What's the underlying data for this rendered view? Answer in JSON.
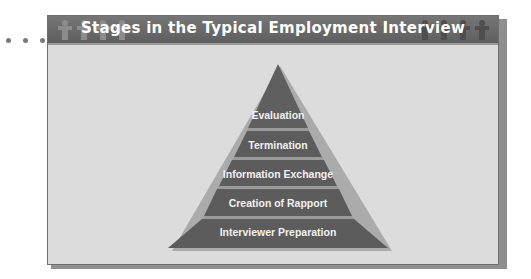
{
  "title": "Stages in the Typical Employment Interview",
  "decor": {
    "dots": 3,
    "people_left": 4,
    "people_right": 4
  },
  "pyramid": {
    "stages": [
      {
        "label": "Evaluation"
      },
      {
        "label": "Termination"
      },
      {
        "label": "Information Exchange"
      },
      {
        "label": "Creation of Rapport"
      },
      {
        "label": "Interviewer Preparation"
      }
    ],
    "colors": {
      "fill": "#5f5f5f",
      "highlight": "#9a9a9a",
      "panel": "#dcdcdc"
    }
  }
}
